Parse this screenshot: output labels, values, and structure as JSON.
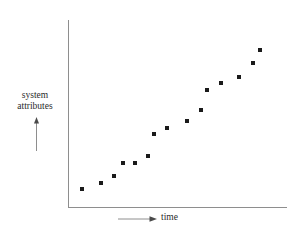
{
  "chart_data": {
    "type": "scatter",
    "title": "",
    "xlabel": "time",
    "ylabel": "system attributes",
    "ylabel_lines": [
      "system",
      "attributes"
    ],
    "grid": false,
    "legend": null,
    "axis_ticks": false,
    "axis_style": "open-ended arrows indicating increasing direction",
    "xlim": [
      0,
      100
    ],
    "ylim": [
      0,
      100
    ],
    "marker": {
      "shape": "square",
      "color": "#1a1a1a",
      "size_px": 4
    },
    "x": [
      6.5,
      15.0,
      21.0,
      25.0,
      30.5,
      36.0,
      39.0,
      45.0,
      54.0,
      60.5,
      63.5,
      70.0,
      78.0,
      84.5,
      88.0
    ],
    "y": [
      9.5,
      12.5,
      16.5,
      23.5,
      23.5,
      27.5,
      39.0,
      42.0,
      46.0,
      51.5,
      62.5,
      66.0,
      69.0,
      77.0,
      83.5
    ],
    "points": [
      {
        "px": 82,
        "py": 189
      },
      {
        "px": 101,
        "py": 183
      },
      {
        "px": 114,
        "py": 176
      },
      {
        "px": 123,
        "py": 163
      },
      {
        "px": 135,
        "py": 163
      },
      {
        "px": 148,
        "py": 156
      },
      {
        "px": 154,
        "py": 134
      },
      {
        "px": 167,
        "py": 128
      },
      {
        "px": 187,
        "py": 121
      },
      {
        "px": 201,
        "py": 110
      },
      {
        "px": 207,
        "py": 90
      },
      {
        "px": 221,
        "py": 83
      },
      {
        "px": 239,
        "py": 77
      },
      {
        "px": 253,
        "py": 63
      },
      {
        "px": 260,
        "py": 50
      }
    ],
    "trend": "monotonically increasing, roughly linear",
    "n_points": 15,
    "colors": {
      "axis": "#8e8e8e",
      "marker": "#1a1a1a",
      "text": "#2b2b2b",
      "background": "#ffffff"
    }
  }
}
